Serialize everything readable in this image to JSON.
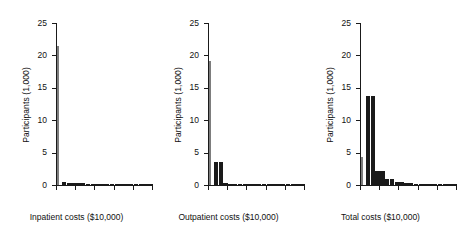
{
  "figure": {
    "background": "#ffffff",
    "bar_color": "#1a1a1a",
    "thin_bar_color": "#7d7d7d",
    "axis_color": "#1a1a1a"
  },
  "chart_data": [
    {
      "type": "bar",
      "title": "",
      "xlabel": "Inpatient costs ($10,000)",
      "ylabel": "Participants (1,000)",
      "xlim": [
        0,
        5
      ],
      "ylim": [
        0,
        25
      ],
      "xticks": [
        "0",
        "1",
        "2",
        "3",
        "4",
        "5"
      ],
      "yticks": [
        "0",
        "5",
        "10",
        "15",
        "20",
        "25"
      ],
      "grid": false,
      "legend": "none",
      "bin_width": 0.25,
      "x": [
        0,
        0.25,
        0.5,
        0.75,
        1.0,
        1.25,
        1.5,
        1.75,
        2.0,
        2.25,
        2.5,
        2.75,
        3.0,
        3.25,
        3.5,
        3.75,
        4.0,
        4.25,
        4.5,
        4.75
      ],
      "values": [
        21.4,
        0.42,
        0.36,
        0.33,
        0.3,
        0.24,
        0.18,
        0.12,
        0.1,
        0.08,
        0.07,
        0.06,
        0.05,
        0.05,
        0.04,
        0.04,
        0.03,
        0.03,
        0.02,
        0.02
      ]
    },
    {
      "type": "bar",
      "title": "",
      "xlabel": "Outpatient costs ($10,000)",
      "ylabel": "Participants (1,000)",
      "xlim": [
        0,
        5
      ],
      "ylim": [
        0,
        25
      ],
      "xticks": [
        "0",
        "1",
        "2",
        "3",
        "4",
        "5"
      ],
      "yticks": [
        "0",
        "5",
        "10",
        "15",
        "20",
        "25"
      ],
      "grid": false,
      "legend": "none",
      "bin_width": 0.25,
      "x": [
        0,
        0.25,
        0.5,
        0.75,
        1.0,
        1.25,
        1.5,
        1.75,
        2.0,
        2.25,
        2.5,
        2.75,
        3.0,
        3.25,
        3.5,
        3.75,
        4.0,
        4.25,
        4.5,
        4.75
      ],
      "values": [
        19.1,
        3.5,
        3.5,
        0.28,
        0.2,
        0.12,
        0.09,
        0.07,
        0.06,
        0.05,
        0.04,
        0.04,
        0.03,
        0.03,
        0.02,
        0.02,
        0.02,
        0.01,
        0.01,
        0.01
      ]
    },
    {
      "type": "bar",
      "title": "",
      "xlabel": "Total costs ($10,000)",
      "ylabel": "Participants (1,000)",
      "xlim": [
        0,
        5
      ],
      "ylim": [
        0,
        25
      ],
      "xticks": [
        "0",
        "1",
        "2",
        "3",
        "4",
        "5"
      ],
      "yticks": [
        "0",
        "5",
        "10",
        "15",
        "20",
        "25"
      ],
      "grid": false,
      "legend": "none",
      "bin_width": 0.25,
      "x": [
        0,
        0.25,
        0.5,
        0.75,
        1.0,
        1.25,
        1.5,
        1.75,
        2.0,
        2.25,
        2.5,
        2.75,
        3.0,
        3.25,
        3.5,
        3.75,
        4.0,
        4.25,
        4.5,
        4.75
      ],
      "values": [
        4.3,
        13.7,
        13.7,
        2.2,
        2.2,
        0.9,
        0.9,
        0.45,
        0.45,
        0.3,
        0.3,
        0.22,
        0.22,
        0.17,
        0.17,
        0.12,
        0.12,
        0.08,
        0.05,
        0.03
      ]
    }
  ]
}
